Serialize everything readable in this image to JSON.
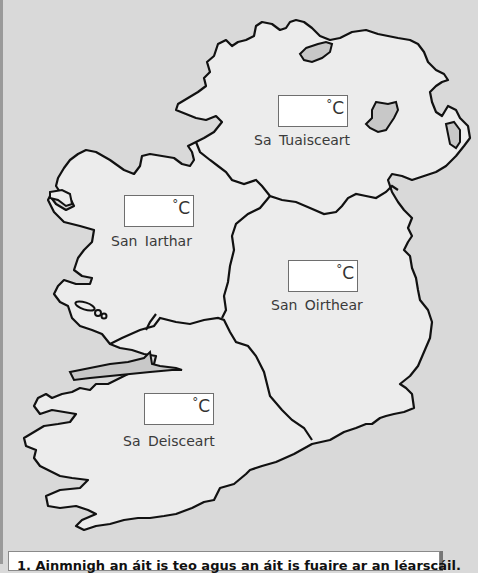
{
  "map": {
    "title": "Ireland regional temperature map",
    "colors": {
      "sea": "#d9d9d9",
      "land": "#ececec",
      "lakes": "#c8c8c8",
      "outline": "#111111"
    },
    "regions": [
      {
        "id": "north",
        "label": "Sa Tuaisceart",
        "unit": "C",
        "degree": "°",
        "value": ""
      },
      {
        "id": "west",
        "label": "San Iarthar",
        "unit": "C",
        "degree": "°",
        "value": ""
      },
      {
        "id": "east",
        "label": "San Oirthear",
        "unit": "C",
        "degree": "°",
        "value": ""
      },
      {
        "id": "south",
        "label": "Sa Deisceart",
        "unit": "C",
        "degree": "°",
        "value": ""
      }
    ]
  },
  "question": {
    "text": "1. Ainmnigh an áit is teo agus an áit is fuaire ar an léarscáil."
  }
}
